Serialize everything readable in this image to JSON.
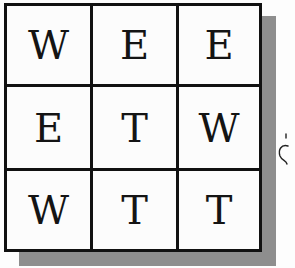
{
  "puzzle": {
    "rows": [
      [
        "W",
        "E",
        "E"
      ],
      [
        "E",
        "T",
        "W"
      ],
      [
        "W",
        "T",
        "T"
      ]
    ]
  },
  "colors": {
    "grid_line": "#111111",
    "shadow": "#8e8e8e",
    "background": "#fdfdfd",
    "letter": "#141414"
  }
}
